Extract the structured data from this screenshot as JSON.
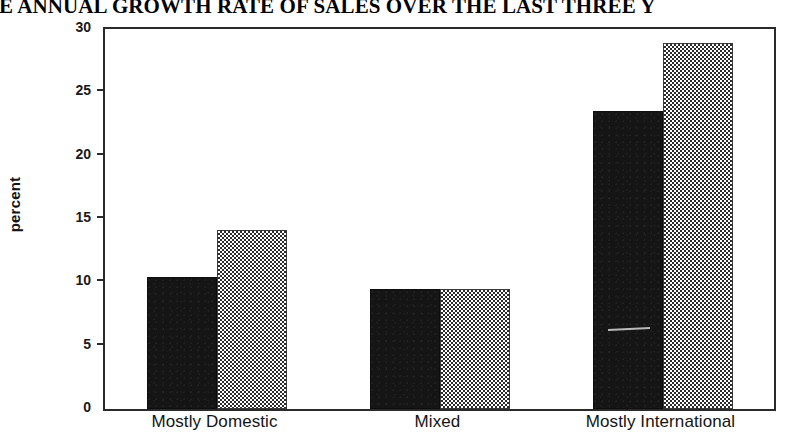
{
  "chart_data": {
    "type": "bar",
    "title": "RAGE ANNUAL GROWTH RATE OF SALES OVER THE LAST THREE Y",
    "title_note": "Title is cropped at the left and right edges of the scan",
    "xlabel": "",
    "ylabel": "percent",
    "ylim": [
      0,
      30
    ],
    "yticks": [
      0,
      5,
      10,
      15,
      20,
      25,
      30
    ],
    "ytick_labels": [
      "0",
      "5",
      "10",
      "15",
      "20",
      "25",
      "30"
    ],
    "categories": [
      "Mostly Domestic",
      "Mixed",
      "Mostly International"
    ],
    "grid": false,
    "legend": "none",
    "series": [
      {
        "name": "series-1",
        "fill": "solid-black",
        "color": "#151515",
        "values": [
          10.4,
          9.5,
          23.5
        ]
      },
      {
        "name": "series-2",
        "fill": "checkered-gray",
        "color": "#808080",
        "values": [
          14.1,
          9.5,
          28.9
        ]
      }
    ]
  },
  "axis": {
    "y_label": "percent"
  }
}
